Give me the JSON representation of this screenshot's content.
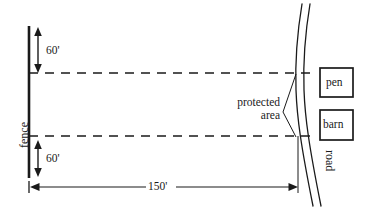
{
  "diagram": {
    "labels": {
      "fence": "fence",
      "road": "road",
      "protected_area_line1": "protected",
      "protected_area_line2": "area",
      "pen": "pen",
      "barn": "barn"
    },
    "dimensions": {
      "top_vertical": "60'",
      "bottom_vertical": "60'",
      "horizontal": "150'"
    },
    "colors": {
      "ink": "#1a1a1a",
      "line": "#2b2b2b",
      "background": "#ffffff"
    }
  }
}
